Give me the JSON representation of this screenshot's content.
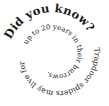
{
  "spiral_text": {
    "headline": "Did you know?",
    "body_outer": "Trapdoor spiders may live for",
    "body_inner": "up to 20 years in their burrows.",
    "full_text": "Did you know? Trapdoor spiders may live for up to 20 years in their burrows."
  },
  "colors": {
    "background": "#ffffff",
    "text": "#1a1a1a"
  }
}
